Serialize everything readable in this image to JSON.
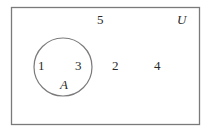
{
  "diagram": {
    "type": "venn",
    "universe": {
      "label": "U",
      "elements_outside_sets": [
        "5",
        "2",
        "4"
      ]
    },
    "sets": [
      {
        "label": "A",
        "elements": [
          "1",
          "3"
        ]
      }
    ],
    "colors": {
      "stroke": "#7a7a7a",
      "text": "#2a2a2a",
      "background": "#ffffff"
    }
  },
  "labels": {
    "universe": "U",
    "set_a": "A",
    "el_1": "1",
    "el_3": "3",
    "el_2": "2",
    "el_4": "4",
    "el_5": "5"
  }
}
